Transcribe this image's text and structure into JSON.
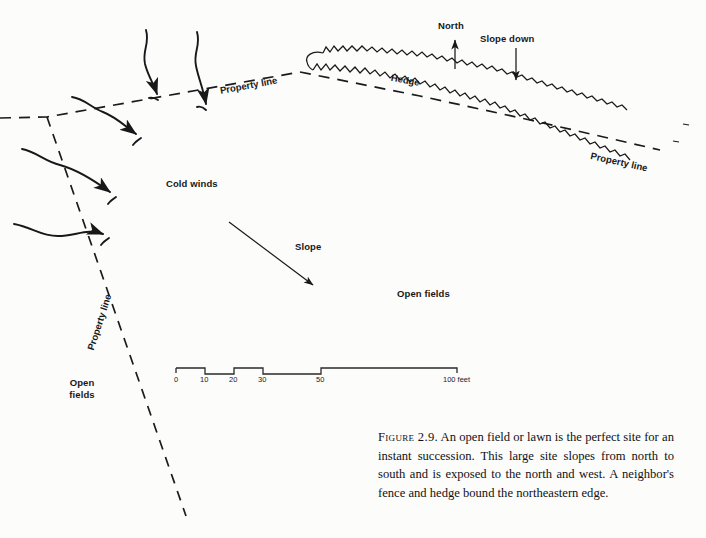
{
  "figure": {
    "type": "landscape-site-plan-diagram",
    "background_color": "#fcfcfb",
    "ink_color": "#18181a"
  },
  "labels": {
    "property_line_top": "Property line",
    "property_line_right": "Property line",
    "property_line_left": "Property line",
    "hedge": "Hedge",
    "north": "North",
    "slope_down": "Slope down",
    "cold_winds": "Cold winds",
    "slope": "Slope",
    "open_fields_center": "Open fields",
    "open_fields_left_line1": "Open",
    "open_fields_left_line2": "fields"
  },
  "scale_bar": {
    "ticks": [
      "0",
      "10",
      "20",
      "30",
      "50"
    ],
    "end_label": "100 feet",
    "unit": "feet",
    "max": 100
  },
  "caption": {
    "figure_number": "Figure 2.9.",
    "text": "An open field or lawn is the perfect site for an instant succession. This large site slopes from north to south and is exposed to the north and west. A neighbor's fence and hedge bound the northeastern edge."
  }
}
